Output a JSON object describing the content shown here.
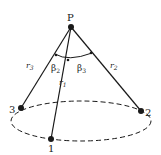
{
  "diagram": {
    "apex": {
      "label": "P",
      "x": 71,
      "y": 27
    },
    "points": [
      {
        "label": "1",
        "x": 51,
        "y": 139
      },
      {
        "label": "2",
        "x": 141,
        "y": 111
      },
      {
        "label": "3",
        "x": 21,
        "y": 108
      }
    ],
    "edges": [
      {
        "label": "r",
        "sub": "1"
      },
      {
        "label": "r",
        "sub": "2"
      },
      {
        "label": "r",
        "sub": "3"
      }
    ],
    "angles": [
      {
        "label": "β",
        "sub": "2"
      },
      {
        "label": "β",
        "sub": "3"
      }
    ],
    "base": {
      "shape": "ellipse",
      "style": "dashed"
    },
    "colors": {
      "line": "#1a1a1a",
      "background": "#ffffff"
    }
  }
}
